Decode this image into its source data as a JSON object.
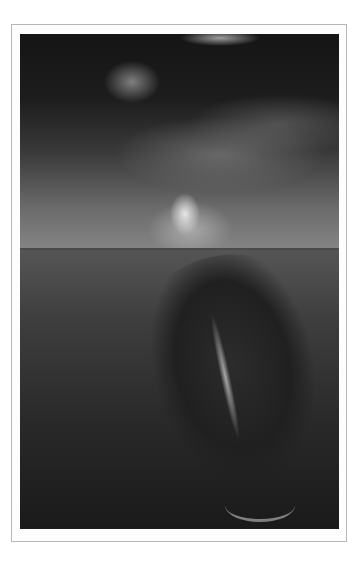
{
  "image": {
    "description": "Split-level grayscale photograph: a swimmer's hand reaching down toward the water surface while a whale's head rises from below, framed in a thin grey border",
    "frame_color": "#b8b8b8",
    "background_color": "#ffffff",
    "subjects": [
      "hand",
      "water-surface",
      "whale"
    ]
  }
}
